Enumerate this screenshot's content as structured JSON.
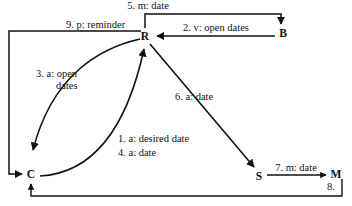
{
  "diagram": {
    "background_color": "#ffffff",
    "ink_color": "#111111",
    "nodes": [
      {
        "id": "R",
        "label": "R",
        "x": 145,
        "y": 36
      },
      {
        "id": "B",
        "label": "B",
        "x": 283,
        "y": 33
      },
      {
        "id": "C",
        "label": "C",
        "x": 31,
        "y": 174
      },
      {
        "id": "S",
        "label": "S",
        "x": 259,
        "y": 176
      },
      {
        "id": "M",
        "label": "M",
        "x": 334,
        "y": 174
      }
    ],
    "edges": [
      {
        "id": "e1",
        "label": "1. a: desired date",
        "from": "C",
        "to": "R",
        "shape": "curve"
      },
      {
        "id": "e2",
        "label": "2.  v: open dates",
        "from": "B",
        "to": "R",
        "shape": "straight"
      },
      {
        "id": "e3",
        "label_line1": "3. a: open",
        "label_line2": "dates",
        "from": "R",
        "to": "C",
        "shape": "curve"
      },
      {
        "id": "e4",
        "label": "4. a: date",
        "from": "C",
        "to": "R",
        "shape": "curve"
      },
      {
        "id": "e5",
        "label": "5. m: date",
        "from": "R",
        "to": "B",
        "shape": "orthogonal"
      },
      {
        "id": "e6",
        "label": "6. a:   date",
        "from": "R",
        "to": "S",
        "shape": "straight"
      },
      {
        "id": "e7",
        "label": "7. m: date",
        "from": "S",
        "to": "M",
        "shape": "straight"
      },
      {
        "id": "e8",
        "label": "8.",
        "from": "M",
        "to": "C",
        "shape": "orthogonal"
      },
      {
        "id": "e9",
        "label": "9. p: reminder",
        "from": "R",
        "to": "C",
        "shape": "orthogonal"
      }
    ]
  }
}
